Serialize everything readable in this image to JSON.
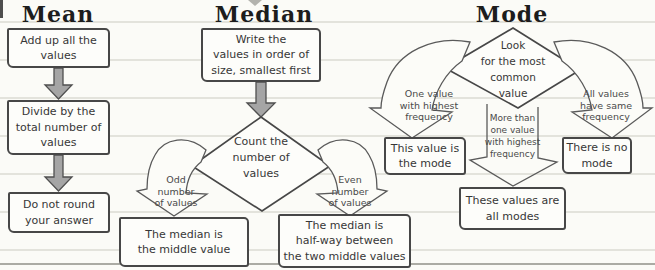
{
  "palette": {
    "paper": "#fbfbf7",
    "rule_line": "#e3e3dc",
    "ink": "#474747",
    "arrow_gray": "#a5a5a5"
  },
  "mean": {
    "title": "Mean",
    "step1": "Add up all the\nvalues",
    "step2": "Divide by the\ntotal number of\nvalues",
    "step3": "Do not round\nyour answer"
  },
  "median": {
    "title": "Median",
    "step1": "Write the\nvalues in order of\nsize, smallest first",
    "decision": "Count the\nnumber of\nvalues",
    "odd_label": "Odd\nnumber\nof values",
    "even_label": "Even\nnumber\nof values",
    "odd_result": "The median is\nthe middle value",
    "even_result": "The median is\nhalf-way between\nthe two middle values"
  },
  "mode": {
    "title": "Mode",
    "decision": "Look\nfor the most\ncommon\nvalue",
    "one_value_label": "One value\nwith highest\nfrequency",
    "more_than_label": "More than\none value\nwith highest\nfrequency",
    "same_freq_label": "All values\nhave same\nfrequency",
    "one_value_result": "This value is\nthe mode",
    "more_than_result": "These values are\nall modes",
    "same_freq_result": "There is no\nmode"
  }
}
